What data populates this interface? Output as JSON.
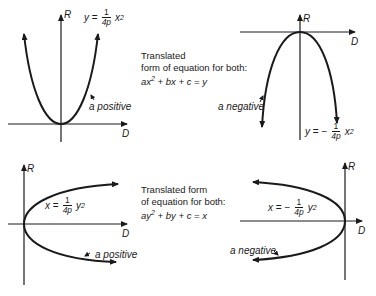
{
  "panels": [
    {
      "id": "top-left",
      "axis_vertical": "R",
      "axis_horizontal": "D",
      "equation": {
        "lhs": "y",
        "sign": "=",
        "num": "1",
        "den": "4p",
        "var": "x",
        "exp": "2"
      },
      "annotation": "a positive"
    },
    {
      "id": "top-right",
      "axis_vertical": "R",
      "axis_horizontal": "D",
      "equation": {
        "lhs": "y",
        "sign": "= −",
        "num": "1",
        "den": "4p",
        "var": "x",
        "exp": "2"
      },
      "annotation": "a negative"
    },
    {
      "id": "bottom-left",
      "axis_vertical": "R",
      "axis_horizontal": "D",
      "equation": {
        "lhs": "x",
        "sign": "=",
        "num": "1",
        "den": "4p",
        "var": "y",
        "exp": "2"
      },
      "annotation": "a positive"
    },
    {
      "id": "bottom-right",
      "axis_vertical": "R",
      "axis_horizontal": "D",
      "equation": {
        "lhs": "x",
        "sign": "= −",
        "num": "1",
        "den": "4p",
        "var": "y",
        "exp": "2"
      },
      "annotation": "a negative"
    }
  ],
  "captions": [
    {
      "line1": "Translated",
      "line2": "form of equation for both:",
      "eq_a": "ax",
      "eq_exp": "2",
      "eq_rest": " + bx + c = y"
    },
    {
      "line1": "Translated form",
      "line2": "of equation for both:",
      "eq_a": "ay",
      "eq_exp": "2",
      "eq_rest": " + by + c = x"
    }
  ],
  "colors": {
    "ink": "#1a1a1a",
    "background": "#ffffff"
  }
}
